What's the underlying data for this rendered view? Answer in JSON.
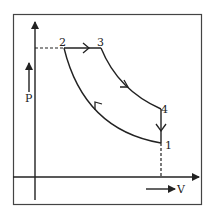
{
  "diagram": {
    "type": "pv-diagram",
    "cycle": "diesel",
    "axes": {
      "y_label": "P",
      "x_label": "V"
    },
    "points": [
      {
        "id": "1",
        "label": "1",
        "x": 161,
        "y": 143
      },
      {
        "id": "2",
        "label": "2",
        "x": 64,
        "y": 48
      },
      {
        "id": "3",
        "label": "3",
        "x": 101,
        "y": 48
      },
      {
        "id": "4",
        "label": "4",
        "x": 161,
        "y": 109
      }
    ],
    "processes": [
      {
        "from": "1",
        "to": "2",
        "kind": "adiabatic compression"
      },
      {
        "from": "2",
        "to": "3",
        "kind": "isobaric heat addition"
      },
      {
        "from": "3",
        "to": "4",
        "kind": "adiabatic expansion"
      },
      {
        "from": "4",
        "to": "1",
        "kind": "isochoric heat rejection"
      }
    ],
    "colors": {
      "line": "#222222",
      "background": "#ffffff",
      "frame": "#444444"
    }
  }
}
